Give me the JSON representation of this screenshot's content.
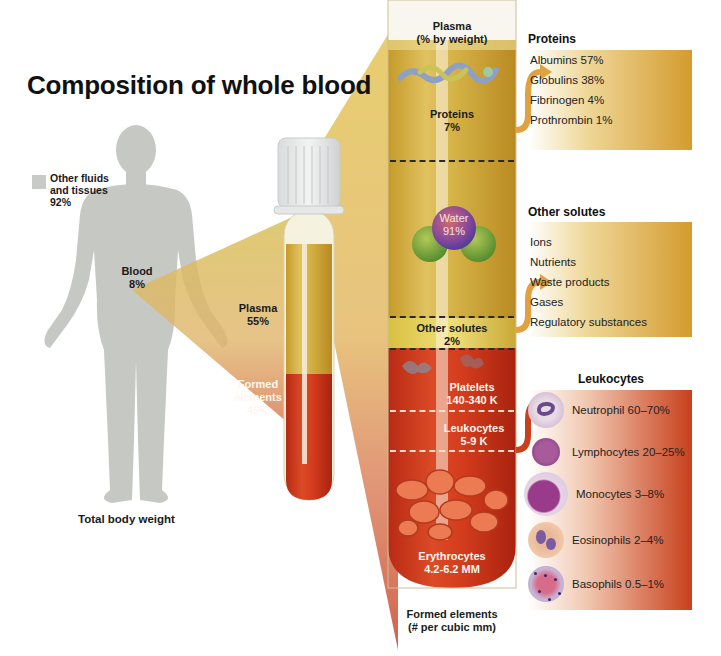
{
  "title": "Composition of whole blood",
  "body_figure": {
    "legend_label_line1": "Other fluids",
    "legend_label_line2": "and tissues",
    "legend_value": "92%",
    "legend_color": "#c8cac6",
    "blood_label": "Blood",
    "blood_value": "8%",
    "caption": "Total body weight"
  },
  "small_tube": {
    "plasma_label": "Plasma",
    "plasma_value": "55%",
    "formed_label_line1": "Formed",
    "formed_label_line2": "elements",
    "formed_value": "45%"
  },
  "big_tube": {
    "top_heading_line1": "Plasma",
    "top_heading_line2": "(% by weight)",
    "bottom_heading_line1": "Formed elements",
    "bottom_heading_line2": "(# per cubic mm)",
    "sections": {
      "proteins": {
        "label": "Proteins",
        "value": "7%"
      },
      "water": {
        "label": "Water",
        "value": "91%"
      },
      "other_solutes": {
        "label": "Other solutes",
        "value": "2%"
      },
      "platelets": {
        "label": "Platelets",
        "value": "140-340 K"
      },
      "leukocytes": {
        "label": "Leukocytes",
        "value": "5-9 K"
      },
      "erythrocytes": {
        "label": "Erythrocytes",
        "value": "4.2-6.2 MM"
      }
    }
  },
  "panels": {
    "proteins": {
      "heading": "Proteins",
      "items": [
        "Albumins  57%",
        "Globulins 38%",
        "Fibrinogen 4%",
        "Prothrombin 1%"
      ]
    },
    "other_solutes": {
      "heading": "Other solutes",
      "items": [
        "Ions",
        "Nutrients",
        "Waste products",
        "Gases",
        "Regulatory substances"
      ]
    },
    "leukocytes": {
      "heading": "Leukocytes",
      "items": [
        "Neutrophil  60–70%",
        "Lymphocytes 20–25%",
        "Monocytes 3–8%",
        "Eosinophils 2–4%",
        "Basophils 0.5–1%"
      ]
    }
  },
  "colors": {
    "plasma": "#d9b23e",
    "formed": "#c9381e",
    "protein_panel": "#d6a236",
    "leukocyte_panel": "#c94a26"
  }
}
